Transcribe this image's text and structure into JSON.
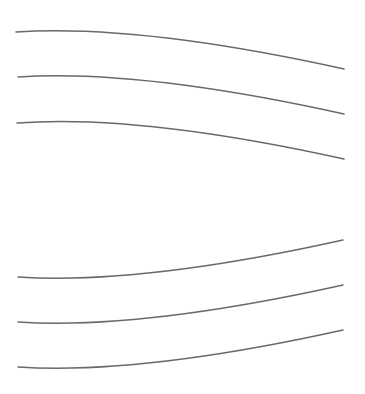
{
  "diagram": {
    "width": 365,
    "height": 394,
    "background": "#ffffff",
    "stroke_color": "#6a6a6a",
    "stroke_width": 1.5,
    "groups": [
      {
        "name": "upper-arcs",
        "orientation": "convex-up",
        "curves": [
          {
            "start": [
              16,
              32
            ],
            "control": [
              140,
              24
            ],
            "end": [
              344,
              69
            ]
          },
          {
            "start": [
              18,
              77
            ],
            "control": [
              140,
              69
            ],
            "end": [
              344,
              114
            ]
          },
          {
            "start": [
              17,
              123
            ],
            "control": [
              140,
              114
            ],
            "end": [
              344,
              159
            ]
          }
        ]
      },
      {
        "name": "lower-arcs",
        "orientation": "convex-down",
        "curves": [
          {
            "start": [
              18,
              277
            ],
            "control": [
              140,
              285
            ],
            "end": [
              343,
              240
            ]
          },
          {
            "start": [
              18,
              322
            ],
            "control": [
              140,
              330
            ],
            "end": [
              343,
              285
            ]
          },
          {
            "start": [
              18,
              367
            ],
            "control": [
              140,
              375
            ],
            "end": [
              343,
              330
            ]
          }
        ]
      }
    ]
  }
}
